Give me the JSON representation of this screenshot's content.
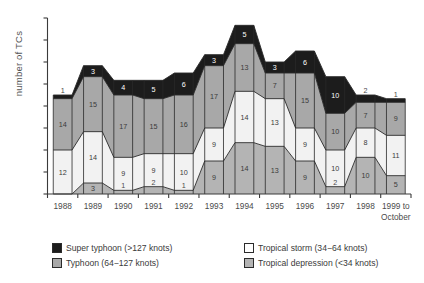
{
  "chart_data": {
    "type": "area",
    "title": "",
    "subtitle": "",
    "xlabel": "",
    "ylabel": "number of TCs",
    "categories": [
      "1988",
      "1989",
      "1990",
      "1991",
      "1992",
      "1993",
      "1994",
      "1995",
      "1996",
      "1997",
      "1998",
      "1999 to October"
    ],
    "x_tick_labels": [
      {
        "line1": "1988",
        "line2": ""
      },
      {
        "line1": "1989",
        "line2": ""
      },
      {
        "line1": "1990",
        "line2": ""
      },
      {
        "line1": "1991",
        "line2": ""
      },
      {
        "line1": "1992",
        "line2": ""
      },
      {
        "line1": "1993",
        "line2": ""
      },
      {
        "line1": "1994",
        "line2": ""
      },
      {
        "line1": "1995",
        "line2": ""
      },
      {
        "line1": "1996",
        "line2": ""
      },
      {
        "line1": "1997",
        "line2": ""
      },
      {
        "line1": "1998",
        "line2": ""
      },
      {
        "line1": "1999 to",
        "line2": "October"
      }
    ],
    "stack_order_bottom_to_top": [
      "Tropical depression",
      "Tropical storm",
      "Typhoon",
      "Super typhoon"
    ],
    "series": [
      {
        "name": "Tropical depression (<34 knots)",
        "short_name": "Tropical depression",
        "color": "#b4b4b4",
        "values": [
          0,
          3,
          1,
          2,
          1,
          9,
          14,
          13,
          9,
          2,
          10,
          5
        ]
      },
      {
        "name": "Tropical storm (34−64 knots)",
        "short_name": "Tropical storm",
        "color": "#f2f2f2",
        "values": [
          12,
          14,
          9,
          9,
          10,
          9,
          14,
          13,
          9,
          10,
          8,
          11
        ]
      },
      {
        "name": "Typhoon (64−127 knots)",
        "short_name": "Typhoon",
        "color": "#a8a8a8",
        "values": [
          14,
          15,
          17,
          15,
          16,
          17,
          13,
          7,
          15,
          10,
          7,
          9
        ]
      },
      {
        "name": "Super typhoon (>127 knots)",
        "short_name": "Super typhoon",
        "color": "#1c1c1c",
        "values": [
          1,
          3,
          4,
          5,
          6,
          3,
          5,
          3,
          6,
          10,
          2,
          1
        ]
      }
    ],
    "totals": [
      27,
      35,
      31,
      31,
      33,
      38,
      46,
      36,
      39,
      32,
      27,
      26
    ],
    "ylim": [
      0,
      48
    ],
    "y_tick_interval": 6,
    "y_tick_labels_shown": false,
    "grid": false,
    "legend_position": "bottom",
    "legend": [
      {
        "label": "Super typhoon (>127 knots)",
        "color": "#1c1c1c"
      },
      {
        "label": "Typhoon (64−127 knots)",
        "color": "#a8a8a8"
      },
      {
        "label": "Tropical storm (34−64 knots)",
        "color": "#ffffff"
      },
      {
        "label": "Tropical depression (<34 knots)",
        "color": "#b4b4b4"
      }
    ]
  },
  "axis": {
    "y_axis_title": "number of TCs"
  }
}
